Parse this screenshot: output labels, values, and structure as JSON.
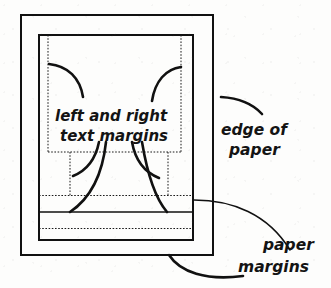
{
  "figure": {
    "background_color": "#fdfdfc",
    "ink_color": "#111111"
  },
  "labels": {
    "text_margins": {
      "line1": "left and right",
      "line2": "text margins"
    },
    "edge_of_paper": {
      "line1": "edge of",
      "line2": "paper"
    },
    "paper_margins": {
      "line1": "paper",
      "line2": "margins"
    }
  },
  "shapes": {
    "outer_rectangle": {
      "name": "edge of paper",
      "x": 21,
      "y": 15,
      "width": 192,
      "height": 240,
      "stroke": "#111111",
      "stroke_width": 2,
      "style": "solid"
    },
    "inner_rectangle": {
      "name": "paper margin box",
      "x": 39,
      "y": 35,
      "width": 154,
      "height": 205,
      "stroke": "#111111",
      "stroke_width": 2,
      "style": "solid"
    },
    "text_margin_box": {
      "name": "text margin box",
      "x": 48,
      "y": 35,
      "width": 133,
      "height": 117,
      "stroke": "#1a1a1a",
      "style": "dotted"
    },
    "dotted_guides": [
      {
        "name": "text-box-bottom",
        "orientation": "horizontal",
        "x1": 48,
        "y1": 152,
        "x2": 181,
        "y2": 152
      },
      {
        "name": "column-gutter-left",
        "orientation": "vertical",
        "x1": 70,
        "y1": 152,
        "x2": 70,
        "y2": 195
      },
      {
        "name": "column-gutter-right",
        "orientation": "vertical",
        "x1": 168,
        "y1": 152,
        "x2": 168,
        "y2": 195
      },
      {
        "name": "upper-paper-margin",
        "orientation": "horizontal",
        "x1": 39,
        "y1": 195,
        "x2": 193,
        "y2": 195
      },
      {
        "name": "lower-paper-margin",
        "orientation": "horizontal",
        "x1": 39,
        "y1": 228,
        "x2": 193,
        "y2": 228
      }
    ],
    "solid_guides": [
      {
        "name": "footer-rule",
        "orientation": "horizontal",
        "x1": 39,
        "y1": 212,
        "x2": 193,
        "y2": 212
      }
    ]
  },
  "pointers": [
    {
      "name": "text-margin-arrow-upper-left",
      "from": [
        49,
        64
      ],
      "to": [
        82,
        96
      ]
    },
    {
      "name": "text-margin-arrow-upper-right",
      "from": [
        152,
        100
      ],
      "to": [
        180,
        67
      ]
    },
    {
      "name": "text-margin-arrow-lower-left-short",
      "from": [
        98,
        144
      ],
      "to": [
        72,
        176
      ]
    },
    {
      "name": "text-margin-arrow-lower-left-long",
      "from": [
        105,
        144
      ],
      "to": [
        70,
        212
      ]
    },
    {
      "name": "text-margin-arrow-lower-right-short",
      "from": [
        133,
        144
      ],
      "to": [
        160,
        177
      ]
    },
    {
      "name": "text-margin-arrow-lower-right-long",
      "from": [
        143,
        144
      ],
      "to": [
        166,
        212
      ]
    },
    {
      "name": "edge-of-paper-pointer",
      "from": [
        222,
        98
      ],
      "to": [
        262,
        112
      ]
    },
    {
      "name": "paper-margins-pointer-upper",
      "from": [
        194,
        200
      ],
      "to": [
        290,
        248
      ]
    },
    {
      "name": "paper-margins-pointer-lower",
      "from": [
        170,
        255
      ],
      "to": [
        243,
        275
      ]
    }
  ]
}
